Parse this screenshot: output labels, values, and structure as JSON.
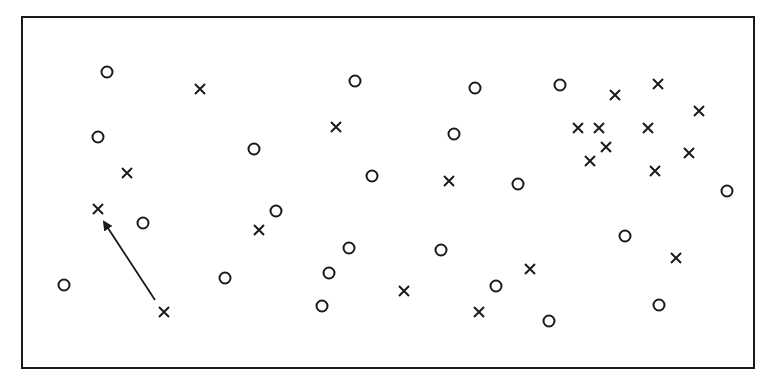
{
  "diagram": {
    "type": "scatter-markers",
    "frame": {
      "x": 22,
      "y": 17,
      "width": 732,
      "height": 351,
      "stroke": "#1a1a1a"
    },
    "marker_color": "#1a1a1a",
    "circles": [
      [
        107,
        72
      ],
      [
        98,
        137
      ],
      [
        143,
        223
      ],
      [
        64,
        285
      ],
      [
        254,
        149
      ],
      [
        276,
        211
      ],
      [
        225,
        278
      ],
      [
        355,
        81
      ],
      [
        372,
        176
      ],
      [
        349,
        248
      ],
      [
        329,
        273
      ],
      [
        322,
        306
      ],
      [
        475,
        88
      ],
      [
        454,
        134
      ],
      [
        441,
        250
      ],
      [
        518,
        184
      ],
      [
        496,
        286
      ],
      [
        549,
        321
      ],
      [
        560,
        85
      ],
      [
        625,
        236
      ],
      [
        659,
        305
      ],
      [
        727,
        191
      ]
    ],
    "crosses": [
      [
        200,
        89
      ],
      [
        127,
        173
      ],
      [
        98,
        209
      ],
      [
        164,
        312
      ],
      [
        259,
        230
      ],
      [
        336,
        127
      ],
      [
        449,
        181
      ],
      [
        404,
        291
      ],
      [
        530,
        269
      ],
      [
        479,
        312
      ],
      [
        615,
        95
      ],
      [
        658,
        84
      ],
      [
        699,
        111
      ],
      [
        578,
        128
      ],
      [
        599,
        128
      ],
      [
        648,
        128
      ],
      [
        606,
        147
      ],
      [
        590,
        161
      ],
      [
        689,
        153
      ],
      [
        655,
        171
      ],
      [
        676,
        258
      ]
    ],
    "arrow": {
      "from": [
        155,
        300
      ],
      "to": [
        104,
        222
      ]
    }
  }
}
